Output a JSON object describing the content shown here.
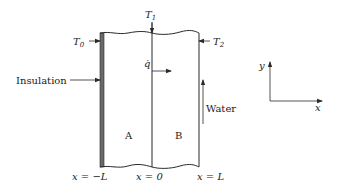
{
  "diagram": {
    "type": "heat-transfer-schematic",
    "regions": [
      {
        "id": "A",
        "label": "A"
      },
      {
        "id": "B",
        "label": "B"
      }
    ],
    "labels": {
      "T0": {
        "main": "T",
        "sub": "0"
      },
      "T1": {
        "main": "T",
        "sub": "1"
      },
      "T2": {
        "main": "T",
        "sub": "2"
      },
      "insulation": "Insulation",
      "heat_flux": "q̇",
      "water": "Water"
    },
    "positions": {
      "left": "x = −L",
      "center": "x = 0",
      "right": "x = L"
    },
    "axes": {
      "x_label": "x",
      "y_label": "y"
    },
    "colors": {
      "line": "#2a2a2a",
      "insulation": "#6a6a6a",
      "text": "#222222"
    }
  }
}
